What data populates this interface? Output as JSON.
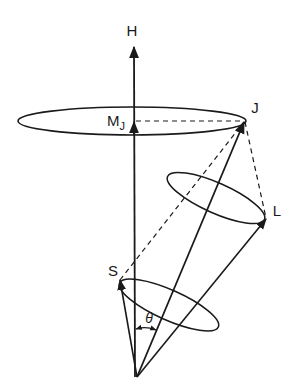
{
  "diagram": {
    "type": "vector-model",
    "labels": {
      "H": "H",
      "M": "M",
      "M_sub": "J",
      "J": "J",
      "L": "L",
      "S": "S",
      "theta": "θ"
    },
    "vectors": [
      {
        "name": "H",
        "from": "origin",
        "to": "H-tip"
      },
      {
        "name": "J",
        "from": "origin",
        "to": "J-tip"
      },
      {
        "name": "L",
        "from": "origin",
        "to": "L-tip"
      },
      {
        "name": "S",
        "from": "origin",
        "to": "S-tip"
      },
      {
        "name": "M_J",
        "from": "origin",
        "to": "M_J-tip"
      }
    ],
    "colors": {
      "ink": "#1a1a1a",
      "background": "#ffffff"
    }
  }
}
